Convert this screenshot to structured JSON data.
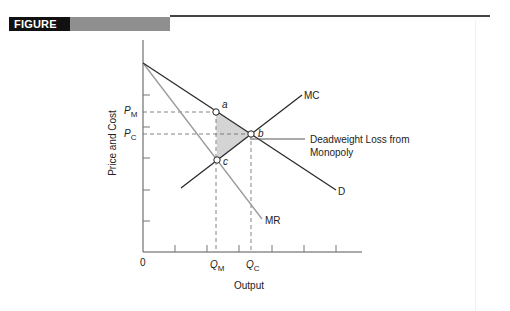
{
  "figure": {
    "label": "FIGURE 2",
    "colors": {
      "banner_black": "#111111",
      "banner_gray": "#8f8f8f",
      "rule": "#444444"
    }
  },
  "diagram": {
    "type": "monopoly deadweight loss",
    "y_axis_label": "Price and Cost",
    "x_axis_label": "Output",
    "origin_label": "0",
    "price_labels": {
      "pm": "P",
      "pm_sub": "M",
      "pc": "P",
      "pc_sub": "C"
    },
    "quantity_labels": {
      "qm": "Q",
      "qm_sub": "M",
      "qc": "Q",
      "qc_sub": "C"
    },
    "curves": {
      "demand": "D",
      "marginal_cost": "MC",
      "marginal_revenue": "MR"
    },
    "points": {
      "a": "a",
      "b": "b",
      "c": "c"
    },
    "annotation_line1": "Deadweight Loss from",
    "annotation_line2": "Monopoly",
    "colors": {
      "curve_dark": "#2a2a2a",
      "curve_mr": "#9a9a9a",
      "deadweight_fill": "#d4d4d4",
      "axis": "#555555"
    }
  }
}
